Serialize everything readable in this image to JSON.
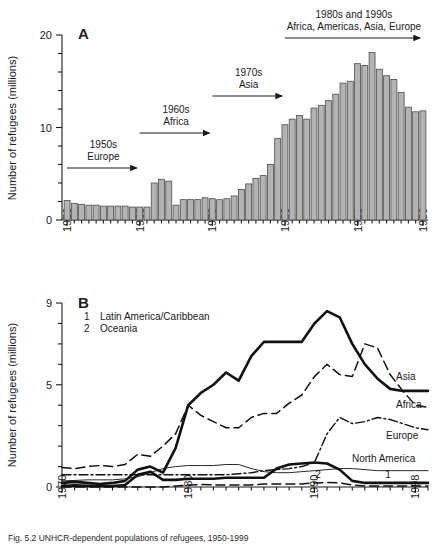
{
  "figure": {
    "caption": "Fig. 5.2   UNHCR-dependent populations of refugees, 1950-1999"
  },
  "chart_data": [
    {
      "type": "bar",
      "panel_letter": "A",
      "title": "",
      "xlabel": "",
      "ylabel": "Number of refugees (millions)",
      "ylim": [
        0,
        20
      ],
      "yticks": [
        0,
        10,
        20
      ],
      "ytick_labels": [
        "0",
        "10",
        "20"
      ],
      "yminor_step": 2,
      "xlim": [
        1950,
        1999
      ],
      "xticks": [
        1950,
        1960,
        1970,
        1980,
        1990,
        1999
      ],
      "xtick_labels": [
        "1950",
        "1960",
        "1970",
        "1980",
        "1990",
        "1999"
      ],
      "grid": false,
      "bar_color": "#b3b3b3",
      "bar_edge_color": "#4d4d4d",
      "categories": [
        1950,
        1951,
        1952,
        1953,
        1954,
        1955,
        1956,
        1957,
        1958,
        1959,
        1960,
        1961,
        1962,
        1963,
        1964,
        1965,
        1966,
        1967,
        1968,
        1969,
        1970,
        1971,
        1972,
        1973,
        1974,
        1975,
        1976,
        1977,
        1978,
        1979,
        1980,
        1981,
        1982,
        1983,
        1984,
        1985,
        1986,
        1987,
        1988,
        1989,
        1990,
        1991,
        1992,
        1993,
        1994,
        1995,
        1996,
        1997,
        1998,
        1999
      ],
      "values": [
        2.1,
        1.8,
        1.7,
        1.6,
        1.6,
        1.5,
        1.5,
        1.5,
        1.5,
        1.4,
        1.4,
        1.4,
        4.0,
        4.4,
        4.2,
        1.6,
        2.2,
        2.2,
        2.2,
        2.4,
        2.3,
        2.2,
        2.3,
        2.6,
        3.3,
        3.9,
        4.5,
        4.8,
        6.0,
        8.8,
        10.3,
        10.9,
        11.3,
        10.9,
        12.1,
        12.4,
        12.9,
        13.6,
        14.8,
        15.0,
        16.9,
        16.7,
        18.1,
        16.3,
        15.6,
        15.2,
        13.8,
        12.2,
        11.7,
        11.8
      ],
      "annotations": [
        {
          "name": "1950s-europe",
          "lines": [
            "1950s",
            "Europe"
          ],
          "arrow_from": 1950,
          "arrow_to": 1960
        },
        {
          "name": "1960s-africa",
          "lines": [
            "1960s",
            "Africa"
          ],
          "arrow_from": 1960,
          "arrow_to": 1970
        },
        {
          "name": "1970s-asia",
          "lines": [
            "1970s",
            "Asia"
          ],
          "arrow_from": 1970,
          "arrow_to": 1980
        },
        {
          "name": "1980s-1990s",
          "lines": [
            "1980s and 1990s",
            "Africa, Americas, Asia, Europe"
          ],
          "arrow_from": 1980,
          "arrow_to": 1999
        }
      ]
    },
    {
      "type": "line",
      "panel_letter": "B",
      "title": "",
      "xlabel": "",
      "ylabel": "Number of refugees (millions)",
      "ylim": [
        0,
        9
      ],
      "yticks": [
        0,
        5,
        9
      ],
      "ytick_labels": [
        "0",
        "5",
        "9"
      ],
      "yminor_step": 1,
      "xlim": [
        1970,
        1999
      ],
      "xticks": [
        1970,
        1980,
        1990,
        1998
      ],
      "xtick_labels": [
        "1970",
        "1980",
        "1990",
        "1998"
      ],
      "grid": false,
      "legend_position": "inline-right",
      "inline_legend": [
        {
          "key": "1",
          "label": "Latin America/Caribbean"
        },
        {
          "key": "2",
          "label": "Oceania"
        }
      ],
      "x": [
        1970,
        1971,
        1972,
        1973,
        1974,
        1975,
        1976,
        1977,
        1978,
        1979,
        1980,
        1981,
        1982,
        1983,
        1984,
        1985,
        1986,
        1987,
        1988,
        1989,
        1990,
        1991,
        1992,
        1993,
        1994,
        1995,
        1996,
        1997,
        1998,
        1999
      ],
      "series": [
        {
          "name": "Asia",
          "label": "Asia",
          "style": "solid-thick",
          "values": [
            0.2,
            0.25,
            0.2,
            0.15,
            0.2,
            0.3,
            0.85,
            1.0,
            0.7,
            1.9,
            4.0,
            4.6,
            5.0,
            5.6,
            5.2,
            6.4,
            7.1,
            7.1,
            7.1,
            7.1,
            8.0,
            8.6,
            8.3,
            7.0,
            6.0,
            5.3,
            4.8,
            4.7,
            4.7,
            4.7
          ]
        },
        {
          "name": "Africa",
          "label": "Africa",
          "style": "dashed",
          "values": [
            0.95,
            0.9,
            1.0,
            1.05,
            1.0,
            1.1,
            1.6,
            1.5,
            2.0,
            2.6,
            4.0,
            3.5,
            3.2,
            2.9,
            2.9,
            3.4,
            3.6,
            3.6,
            4.1,
            4.5,
            5.4,
            6.0,
            5.5,
            5.4,
            7.0,
            6.8,
            5.5,
            4.7,
            4.0,
            3.9
          ]
        },
        {
          "name": "Europe",
          "label": "Europe",
          "style": "dash-dot",
          "values": [
            0.6,
            0.6,
            0.6,
            0.6,
            0.6,
            0.6,
            0.6,
            0.6,
            0.6,
            0.6,
            0.6,
            0.6,
            0.6,
            0.6,
            0.65,
            0.7,
            0.8,
            0.85,
            0.9,
            1.0,
            1.2,
            2.6,
            3.4,
            3.1,
            3.2,
            3.4,
            3.3,
            3.1,
            2.9,
            2.8
          ]
        },
        {
          "name": "North America",
          "label": "North America",
          "style": "solid-thin",
          "values": [
            0.3,
            0.32,
            0.35,
            0.35,
            0.35,
            0.4,
            0.5,
            0.7,
            0.9,
            1.0,
            1.05,
            1.05,
            1.05,
            1.1,
            1.1,
            0.9,
            0.75,
            0.7,
            0.7,
            0.75,
            0.8,
            0.85,
            0.9,
            0.9,
            0.85,
            0.8,
            0.8,
            0.8,
            0.8,
            0.8
          ]
        },
        {
          "name": "Latin America/Caribbean",
          "label": "1",
          "style": "solid-thick-low",
          "values": [
            0.05,
            0.08,
            0.06,
            0.05,
            0.05,
            0.1,
            0.6,
            0.75,
            0.35,
            0.35,
            0.4,
            0.4,
            0.4,
            0.45,
            0.45,
            0.45,
            0.45,
            0.9,
            1.1,
            1.15,
            1.2,
            1.15,
            0.85,
            0.3,
            0.2,
            0.2,
            0.2,
            0.2,
            0.2,
            0.2
          ]
        },
        {
          "name": "Oceania",
          "label": "2",
          "style": "dashed-low",
          "values": [
            0.0,
            0.0,
            0.0,
            0.0,
            0.0,
            0.0,
            0.0,
            0.0,
            0.0,
            0.05,
            0.1,
            0.12,
            0.1,
            0.1,
            0.1,
            0.1,
            0.15,
            0.15,
            0.15,
            0.15,
            0.2,
            0.22,
            0.2,
            0.1,
            0.05,
            0.05,
            0.05,
            0.05,
            0.05,
            0.05
          ]
        }
      ]
    }
  ]
}
